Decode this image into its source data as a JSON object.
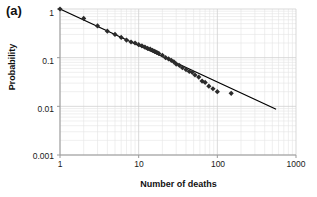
{
  "figure": {
    "panel_label": "(a)",
    "background_color": "#ffffff"
  },
  "chart_data": {
    "type": "scatter",
    "title": "",
    "panel": "(a)",
    "xlabel": "Number of deaths",
    "ylabel": "Probability",
    "xscale": "log",
    "yscale": "log",
    "xlim": [
      1,
      1000
    ],
    "ylim": [
      0.001,
      1
    ],
    "xticks": [
      1,
      10,
      100,
      1000
    ],
    "xticklabels": [
      "1",
      "10",
      "100",
      "1000"
    ],
    "yticks": [
      1,
      0.1,
      0.01,
      0.001
    ],
    "yticklabels": [
      "1",
      "0.1",
      "0.01",
      "0.001"
    ],
    "grid": true,
    "grid_minor": true,
    "grid_color": "#e4e4e4",
    "legend": null,
    "marker_color": "#2b2b2b",
    "marker_shape": "diamond",
    "marker_size": 2.6,
    "series": [
      {
        "name": "observed probability",
        "type": "scatter",
        "x": [
          1,
          2,
          3,
          4,
          5,
          6,
          7,
          8,
          9,
          10,
          11,
          12,
          13,
          14,
          15,
          16,
          17,
          18,
          20,
          22,
          24,
          26,
          28,
          30,
          33,
          36,
          40,
          44,
          48,
          52,
          58,
          64,
          70,
          78,
          88,
          100,
          150
        ],
        "y": [
          1.0,
          0.64,
          0.45,
          0.35,
          0.3,
          0.26,
          0.23,
          0.21,
          0.2,
          0.185,
          0.175,
          0.165,
          0.155,
          0.15,
          0.142,
          0.135,
          0.128,
          0.122,
          0.112,
          0.1,
          0.094,
          0.088,
          0.082,
          0.074,
          0.069,
          0.062,
          0.057,
          0.052,
          0.05,
          0.044,
          0.04,
          0.033,
          0.031,
          0.026,
          0.023,
          0.02,
          0.0185
        ]
      },
      {
        "name": "power-law fit",
        "type": "line",
        "color": "#000000",
        "linewidth": 1.3,
        "x": [
          1,
          550
        ],
        "y": [
          1.0,
          0.0088
        ],
        "slope_loglog": -0.748
      }
    ]
  }
}
